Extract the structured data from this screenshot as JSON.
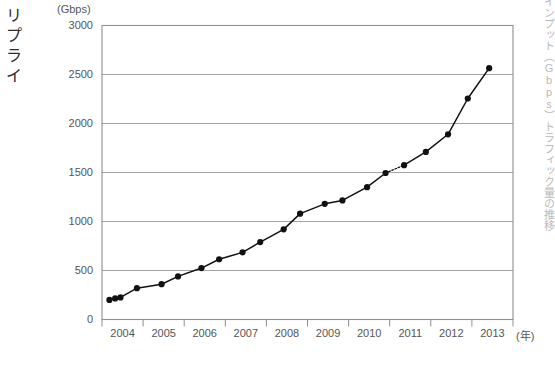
{
  "left_caption": "リプライ",
  "right_caption": "インプット（Gbps）トラフィック量の推移",
  "chart_data": {
    "type": "line",
    "title": "",
    "subtitle": "",
    "xlabel": "(年)",
    "ylabel": "(Gbps)",
    "y_unit": "(Gbps)",
    "x_unit": "(年)",
    "grid": true,
    "legend": "none",
    "xlim": [
      2004,
      2014
    ],
    "ylim": [
      0,
      3000
    ],
    "yticks": [
      3000,
      2500,
      2000,
      1500,
      1000,
      500,
      0
    ],
    "ytick_labels": [
      "3000",
      "2500",
      "2000",
      "1500",
      "1000",
      "500",
      "0"
    ],
    "xticks": [
      2004,
      2005,
      2006,
      2007,
      2008,
      2009,
      2010,
      2011,
      2012,
      2013
    ],
    "xtick_labels": [
      "2004",
      "2005",
      "2006",
      "2007",
      "2008",
      "2009",
      "2010",
      "2011",
      "2012",
      "2013"
    ],
    "series": [
      {
        "name": "トラフィック量",
        "marker": "filled-circle",
        "color": "#111111",
        "points": [
          {
            "x": 2004.18,
            "y": 200
          },
          {
            "x": 2004.32,
            "y": 215
          },
          {
            "x": 2004.45,
            "y": 225
          },
          {
            "x": 2004.85,
            "y": 320
          },
          {
            "x": 2005.45,
            "y": 360
          },
          {
            "x": 2005.85,
            "y": 440
          },
          {
            "x": 2006.42,
            "y": 525
          },
          {
            "x": 2006.85,
            "y": 615
          },
          {
            "x": 2007.42,
            "y": 685
          },
          {
            "x": 2007.85,
            "y": 790
          },
          {
            "x": 2008.42,
            "y": 920
          },
          {
            "x": 2008.82,
            "y": 1080
          },
          {
            "x": 2009.42,
            "y": 1180
          },
          {
            "x": 2009.85,
            "y": 1215
          },
          {
            "x": 2010.45,
            "y": 1350
          },
          {
            "x": 2010.9,
            "y": 1495
          },
          {
            "x": 2011.35,
            "y": 1575
          },
          {
            "x": 2011.88,
            "y": 1710
          },
          {
            "x": 2012.42,
            "y": 1890
          },
          {
            "x": 2012.9,
            "y": 2255
          },
          {
            "x": 2013.42,
            "y": 2565
          }
        ],
        "dashed_segment": {
          "from_index": 15,
          "to_index": 16,
          "note": "点線"
        }
      }
    ]
  }
}
